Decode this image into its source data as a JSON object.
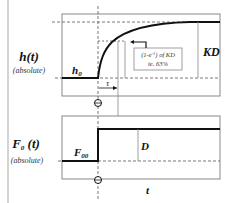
{
  "top_plot": {
    "y_label": "h(t)",
    "y_sublabel": "(absolute)",
    "initial_label": "h",
    "initial_sub": "0",
    "gain_label": "KD",
    "tau_label": "τ",
    "annotation_line1": "(1-e",
    "annotation_sup": "-1",
    "annotation_line1b": ") of KD",
    "annotation_line2": "ie. 63%"
  },
  "bottom_plot": {
    "y_label": "F",
    "y_label_sub": "0",
    "y_label_tail": " (t)",
    "y_sublabel": "(absolute)",
    "initial_label": "F",
    "initial_sub": "00",
    "step_label": "D",
    "x_label": "t"
  },
  "colors": {
    "line": "#111111",
    "box": "#888888",
    "dash": "#555555"
  }
}
